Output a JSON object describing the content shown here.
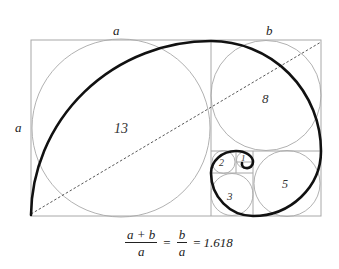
{
  "diagram": {
    "colors": {
      "spiral": "#111111",
      "grid": "#a8a8a8",
      "diagonal": "#444444",
      "background": "#ffffff"
    },
    "labels": {
      "top_a": "a",
      "top_b": "b",
      "left_a": "a"
    },
    "squares": [
      {
        "label": "13",
        "x": 31,
        "y": 40,
        "size": 180
      },
      {
        "label": "8",
        "x": 211,
        "y": 40,
        "size": 110
      },
      {
        "label": "5",
        "x": 253,
        "y": 151,
        "size": 68
      },
      {
        "label": "3",
        "x": 211,
        "y": 173,
        "size": 42
      },
      {
        "label": "2",
        "x": 211,
        "y": 151,
        "size": 25
      },
      {
        "label": "1",
        "x": 236,
        "y": 151,
        "size": 17
      }
    ],
    "formula": {
      "lhs_numerator": "a + b",
      "lhs_denominator": "a",
      "equals1": "=",
      "mid_numerator": "b",
      "mid_denominator": "a",
      "equals2": "=",
      "value": "1.618"
    }
  }
}
